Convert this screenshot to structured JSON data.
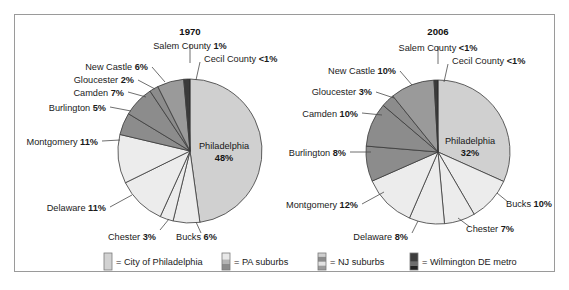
{
  "figure": {
    "border_color": "#9a9a9a",
    "background": "#ffffff"
  },
  "legend": {
    "items": [
      {
        "label": "= City of Philadelphia",
        "swatch": "city-swatch",
        "color": "#d2d2d2"
      },
      {
        "label": "= PA suburbs",
        "swatch": "pa-suburbs-swatch",
        "color": "#e6e6e6"
      },
      {
        "label": "= NJ suburbs",
        "swatch": "nj-suburbs-swatch",
        "color": "#8f8f8f"
      },
      {
        "label": "= Wilmington DE metro",
        "swatch": "wilmington-swatch",
        "color": "#4a4a4a"
      }
    ]
  },
  "chart_data": [
    {
      "type": "pie",
      "title": "1970",
      "categories": [
        "Philadelphia",
        "Bucks",
        "Chester",
        "Delaware",
        "Montgomery",
        "Burlington",
        "Camden",
        "Gloucester",
        "New Castle",
        "Salem County",
        "Cecil County"
      ],
      "values": [
        48,
        6,
        3,
        11,
        11,
        5,
        7,
        2,
        6,
        1,
        0.4
      ],
      "labels": [
        {
          "name": "Philadelphia",
          "pct": "48%",
          "group": "City of Philadelphia",
          "color": "#d0d0d0"
        },
        {
          "name": "Bucks",
          "pct": "6%",
          "group": "PA suburbs",
          "color": "#ececec"
        },
        {
          "name": "Chester",
          "pct": "3%",
          "group": "PA suburbs",
          "color": "#ececec"
        },
        {
          "name": "Delaware",
          "pct": "11%",
          "group": "PA suburbs",
          "color": "#ececec"
        },
        {
          "name": "Montgomery",
          "pct": "11%",
          "group": "PA suburbs",
          "color": "#ececec"
        },
        {
          "name": "Burlington",
          "pct": "5%",
          "group": "NJ suburbs",
          "color": "#8c8c8c"
        },
        {
          "name": "Camden",
          "pct": "7%",
          "group": "NJ suburbs",
          "color": "#8c8c8c"
        },
        {
          "name": "Gloucester",
          "pct": "2%",
          "group": "NJ suburbs",
          "color": "#8c8c8c"
        },
        {
          "name": "New Castle",
          "pct": "6%",
          "group": "NJ suburbs",
          "color": "#9a9a9a"
        },
        {
          "name": "Salem County",
          "pct": "1%",
          "group": "Wilmington DE metro",
          "color": "#3a3a3a"
        },
        {
          "name": "Cecil County",
          "pct": "<1%",
          "group": "Wilmington DE metro",
          "color": "#2a2a2a"
        }
      ],
      "xlabel": "",
      "ylabel": "",
      "legend_position": "bottom"
    },
    {
      "type": "pie",
      "title": "2006",
      "categories": [
        "Philadelphia",
        "Bucks",
        "Chester",
        "Delaware",
        "Montgomery",
        "Burlington",
        "Camden",
        "Gloucester",
        "New Castle",
        "Salem County",
        "Cecil County"
      ],
      "values": [
        32,
        10,
        7,
        8,
        12,
        8,
        10,
        3,
        10,
        0.5,
        0.4
      ],
      "labels": [
        {
          "name": "Philadelphia",
          "pct": "32%",
          "group": "City of Philadelphia",
          "color": "#d0d0d0"
        },
        {
          "name": "Bucks",
          "pct": "10%",
          "group": "PA suburbs",
          "color": "#ececec"
        },
        {
          "name": "Chester",
          "pct": "7%",
          "group": "PA suburbs",
          "color": "#ececec"
        },
        {
          "name": "Delaware",
          "pct": "8%",
          "group": "PA suburbs",
          "color": "#ececec"
        },
        {
          "name": "Montgomery",
          "pct": "12%",
          "group": "PA suburbs",
          "color": "#ececec"
        },
        {
          "name": "Burlington",
          "pct": "8%",
          "group": "NJ suburbs",
          "color": "#8c8c8c"
        },
        {
          "name": "Camden",
          "pct": "10%",
          "group": "NJ suburbs",
          "color": "#8c8c8c"
        },
        {
          "name": "Gloucester",
          "pct": "3%",
          "group": "NJ suburbs",
          "color": "#8c8c8c"
        },
        {
          "name": "New Castle",
          "pct": "10%",
          "group": "NJ suburbs",
          "color": "#9a9a9a"
        },
        {
          "name": "Salem County",
          "pct": "<1%",
          "group": "Wilmington DE metro",
          "color": "#3a3a3a"
        },
        {
          "name": "Cecil County",
          "pct": "<1%",
          "group": "Wilmington DE metro",
          "color": "#2a2a2a"
        }
      ],
      "xlabel": "",
      "ylabel": "",
      "legend_position": "bottom"
    }
  ],
  "chart1": {
    "title": "1970",
    "callouts": {
      "salem": {
        "name": "Salem County",
        "pct": "1%"
      },
      "cecil": {
        "name": "Cecil County",
        "pct": "<1%"
      },
      "newcastle": {
        "name": "New Castle",
        "pct": "6%"
      },
      "gloucester": {
        "name": "Gloucester",
        "pct": "2%"
      },
      "camden": {
        "name": "Camden",
        "pct": "7%"
      },
      "burlington": {
        "name": "Burlington",
        "pct": "5%"
      },
      "montgomery": {
        "name": "Montgomery",
        "pct": "11%"
      },
      "delaware": {
        "name": "Delaware",
        "pct": "11%"
      },
      "chester": {
        "name": "Chester",
        "pct": "3%"
      },
      "bucks": {
        "name": "Bucks",
        "pct": "6%"
      },
      "philadelphia": {
        "name": "Philadelphia",
        "pct": "48%"
      }
    }
  },
  "chart2": {
    "title": "2006",
    "callouts": {
      "salem": {
        "name": "Salem County",
        "pct": "<1%"
      },
      "cecil": {
        "name": "Cecil County",
        "pct": "<1%"
      },
      "newcastle": {
        "name": "New Castle",
        "pct": "10%"
      },
      "gloucester": {
        "name": "Gloucester",
        "pct": "3%"
      },
      "camden": {
        "name": "Camden",
        "pct": "10%"
      },
      "burlington": {
        "name": "Burlington",
        "pct": "8%"
      },
      "montgomery": {
        "name": "Montgomery",
        "pct": "12%"
      },
      "delaware": {
        "name": "Delaware",
        "pct": "8%"
      },
      "chester": {
        "name": "Chester",
        "pct": "7%"
      },
      "bucks": {
        "name": "Bucks",
        "pct": "10%"
      },
      "philadelphia": {
        "name": "Philadelphia",
        "pct": "32%"
      }
    }
  }
}
